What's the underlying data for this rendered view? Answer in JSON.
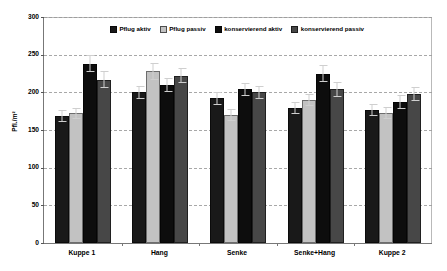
{
  "chart_data": {
    "type": "bar",
    "title": "",
    "subtitle": "",
    "xlabel": "",
    "ylabel": "Pfl./m²",
    "ylim": [
      0,
      300
    ],
    "yticks": [
      0,
      50,
      100,
      150,
      200,
      250,
      300
    ],
    "grid": true,
    "legend_position": "top-center",
    "categories": [
      "Kuppe 1",
      "Hang",
      "Senke",
      "Senke+Hang",
      "Kuppe 2"
    ],
    "series": [
      {
        "name": "Pflug aktiv",
        "color": "#191919",
        "values": [
          168,
          200,
          192,
          179,
          176
        ],
        "errors": [
          8,
          9,
          9,
          8,
          8
        ]
      },
      {
        "name": "Pflug passiv",
        "color": "#c2c2c2",
        "values": [
          172,
          228,
          170,
          190,
          172
        ],
        "errors": [
          7,
          11,
          8,
          8,
          8
        ]
      },
      {
        "name": "konservierend aktiv",
        "color": "#0d0d0d",
        "values": [
          238,
          210,
          204,
          225,
          187
        ],
        "errors": [
          11,
          9,
          9,
          11,
          9
        ]
      },
      {
        "name": "konservierend passiv",
        "color": "#474747",
        "values": [
          217,
          222,
          200,
          204,
          198
        ],
        "errors": [
          11,
          10,
          9,
          10,
          9
        ]
      }
    ]
  },
  "legend": {
    "items": [
      {
        "label": "Pflug aktiv"
      },
      {
        "label": "Pflug passiv"
      },
      {
        "label": "konservierend aktiv"
      },
      {
        "label": "konservierend passiv"
      }
    ]
  },
  "axes": {
    "y_title": "Pfl./m²",
    "y_tick_labels": [
      "300",
      "250",
      "200",
      "150",
      "100",
      "50",
      "0"
    ],
    "x_tick_labels": [
      "Kuppe 1",
      "Hang",
      "Senke",
      "Senke+Hang",
      "Kuppe 2"
    ]
  }
}
